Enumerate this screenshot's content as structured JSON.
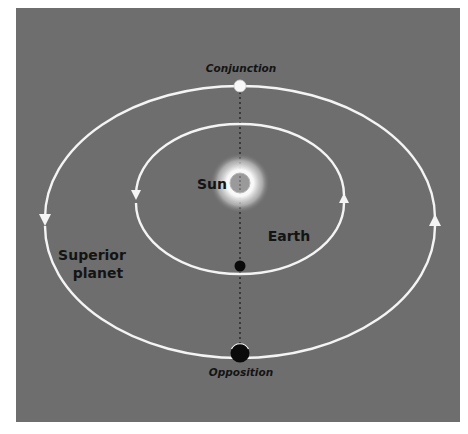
{
  "diagram": {
    "labels": {
      "conjunction": "Conjunction",
      "opposition": "Opposition",
      "sun": "Sun",
      "earth": "Earth",
      "superior_planet_line1": "Superior",
      "superior_planet_line2": "planet"
    },
    "colors": {
      "background": "#6e6e6e",
      "orbit": "#f4f4f4",
      "label": "#141414",
      "sun_core": "#9a9a9a",
      "sun_glow": "#ffffff",
      "planet_dark": "#0a0a0a",
      "planet_light": "#f8f8f8"
    },
    "orbits": [
      {
        "name": "earth-orbit",
        "cx": 240,
        "cy": 195,
        "rx": 104,
        "ry": 71,
        "direction": "counterclockwise"
      },
      {
        "name": "superior-planet-orbit",
        "cx": 240,
        "cy": 218,
        "rx": 195,
        "ry": 132,
        "direction": "counterclockwise"
      }
    ],
    "bodies": [
      {
        "name": "sun",
        "x": 240,
        "y": 183
      },
      {
        "name": "earth",
        "x": 240,
        "y": 266
      },
      {
        "name": "planet-at-conjunction",
        "x": 240,
        "y": 86
      },
      {
        "name": "planet-at-opposition",
        "x": 240,
        "y": 353
      }
    ]
  }
}
